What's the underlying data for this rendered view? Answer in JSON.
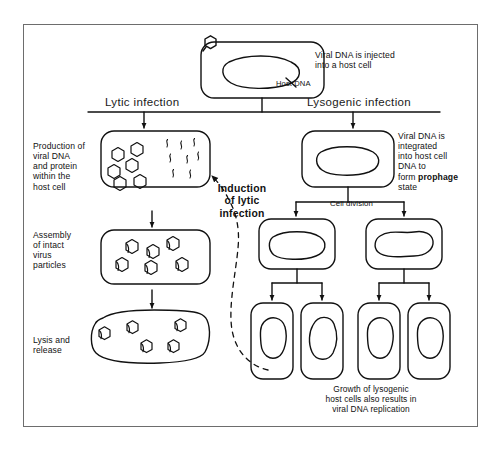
{
  "diagram": {
    "frame_color": "#6d6d6d",
    "ink_color": "#111111",
    "branches": {
      "lytic_label": "Lytic infection",
      "lysogenic_label": "Lysogenic infection"
    },
    "labels": {
      "injection": "Viral DNA is injected\ninto a host cell",
      "host_dna": "Host DNA",
      "production": "Production of\nviral DNA\nand protein\nwithin the\nhost cell",
      "assembly": "Assembly\nof intact\nvirus\nparticles",
      "lysis": "Lysis and\nrelease",
      "integration_pre": "Viral DNA is\nintegrated\ninto host cell\nDNA to\nform ",
      "integration_bold": "prophage",
      "integration_post": "\nstate",
      "induction": "Induction\nof lytic\ninfection",
      "cell_division": "Cell division",
      "growth_caption": "Growth of lysogenic\nhost cells also results in\nviral DNA replication"
    },
    "counts": {
      "production_capsids": 6,
      "production_dna_strands": 8,
      "assembly_particles": 6,
      "lysis_particles": 5,
      "daughter_cells_first_division": 2,
      "daughter_cells_second_division": 4
    }
  }
}
